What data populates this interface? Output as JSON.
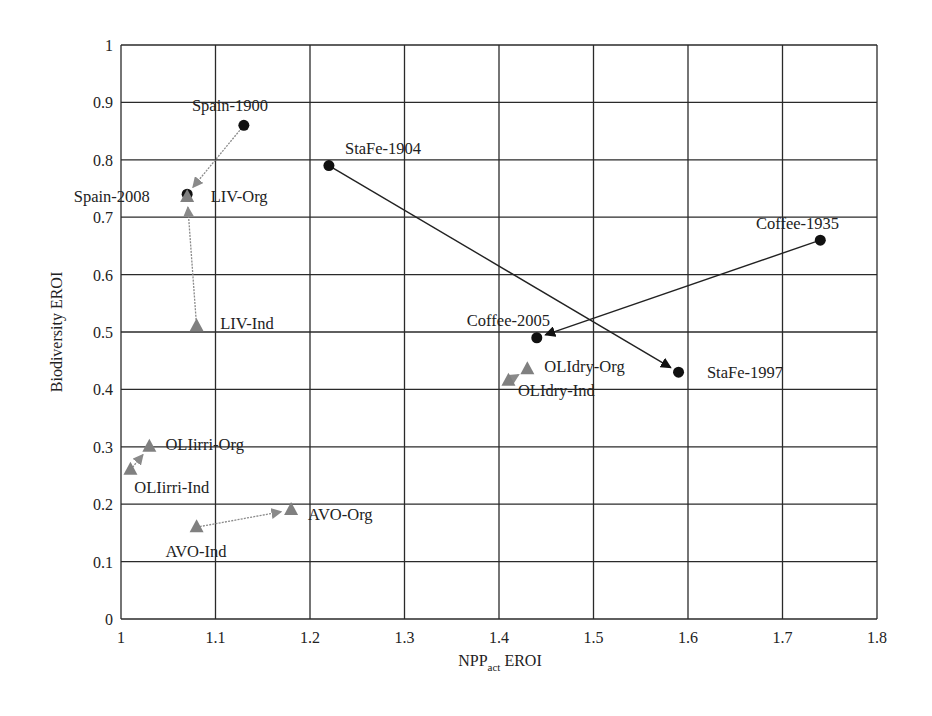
{
  "chart_data": {
    "type": "scatter",
    "title": "",
    "xlabel": "NPP_act EROI",
    "xlabel_main": "NPP",
    "xlabel_sub": "act",
    "xlabel_suffix": " EROI",
    "ylabel": "Biodiversity EROI",
    "xlim": [
      1,
      1.8
    ],
    "ylim": [
      0,
      1
    ],
    "x_ticks": [
      "1",
      "1.1",
      "1.2",
      "1.3",
      "1.4",
      "1.5",
      "1.6",
      "1.7",
      "1.8"
    ],
    "y_ticks": [
      "0",
      "0.1",
      "0.2",
      "0.3",
      "0.4",
      "0.5",
      "0.6",
      "0.7",
      "0.8",
      "0.9",
      "1"
    ],
    "grid": true,
    "legend": "none",
    "series": [
      {
        "name": "Spain",
        "marker": "circle",
        "color": "#111111",
        "arrow_color": "#8a8a8a",
        "arrow_style": "dotted",
        "points": [
          {
            "label": "Spain-1900",
            "x": 1.13,
            "y": 0.86
          },
          {
            "label": "Spain-2008",
            "x": 1.07,
            "y": 0.74
          }
        ]
      },
      {
        "name": "LIV",
        "marker": "triangle",
        "color": "#808080",
        "arrow_color": "#8a8a8a",
        "arrow_style": "dotted",
        "points": [
          {
            "label": "LIV-Ind",
            "x": 1.08,
            "y": 0.51
          },
          {
            "label": "LIV-Org",
            "x": 1.07,
            "y": 0.735
          }
        ]
      },
      {
        "name": "StaFe",
        "marker": "circle",
        "color": "#111111",
        "arrow_color": "#222222",
        "arrow_style": "solid",
        "points": [
          {
            "label": "StaFe-1904",
            "x": 1.22,
            "y": 0.79
          },
          {
            "label": "StaFe-1997",
            "x": 1.59,
            "y": 0.43
          }
        ]
      },
      {
        "name": "Coffee",
        "marker": "circle",
        "color": "#111111",
        "arrow_color": "#222222",
        "arrow_style": "solid",
        "points": [
          {
            "label": "Coffee-1935",
            "x": 1.74,
            "y": 0.66
          },
          {
            "label": "Coffee-2005",
            "x": 1.44,
            "y": 0.49
          }
        ]
      },
      {
        "name": "OLIdry",
        "marker": "triangle",
        "color": "#808080",
        "arrow_color": "#8a8a8a",
        "arrow_style": "dotted",
        "points": [
          {
            "label": "OLIdry-Ind",
            "x": 1.41,
            "y": 0.415
          },
          {
            "label": "OLIdry-Org",
            "x": 1.43,
            "y": 0.435
          }
        ]
      },
      {
        "name": "OLIirri",
        "marker": "triangle",
        "color": "#808080",
        "arrow_color": "#8a8a8a",
        "arrow_style": "dotted",
        "points": [
          {
            "label": "OLIirri-Ind",
            "x": 1.01,
            "y": 0.26
          },
          {
            "label": "OLIirri-Org",
            "x": 1.03,
            "y": 0.3
          }
        ]
      },
      {
        "name": "AVO",
        "marker": "triangle",
        "color": "#808080",
        "arrow_color": "#8a8a8a",
        "arrow_style": "dotted",
        "points": [
          {
            "label": "AVO-Ind",
            "x": 1.08,
            "y": 0.16
          },
          {
            "label": "AVO-Org",
            "x": 1.18,
            "y": 0.19
          }
        ]
      }
    ],
    "annotations": [
      {
        "text": "Spain-1900",
        "x": 1.075,
        "y": 0.885
      },
      {
        "text": "Spain-2008",
        "x": 0.95,
        "y": 0.727
      },
      {
        "text": "LIV-Org",
        "x": 1.095,
        "y": 0.727
      },
      {
        "text": "LIV-Ind",
        "x": 1.105,
        "y": 0.505
      },
      {
        "text": "StaFe-1904",
        "x": 1.237,
        "y": 0.81
      },
      {
        "text": "StaFe-1997",
        "x": 1.62,
        "y": 0.42
      },
      {
        "text": "Coffee-1935",
        "x": 1.672,
        "y": 0.68
      },
      {
        "text": "Coffee-2005",
        "x": 1.366,
        "y": 0.51
      },
      {
        "text": "OLIdry-Org",
        "x": 1.448,
        "y": 0.43
      },
      {
        "text": "OLIdry-Ind",
        "x": 1.42,
        "y": 0.388
      },
      {
        "text": "OLIirri-Org",
        "x": 1.047,
        "y": 0.295
      },
      {
        "text": "OLIirri-Ind",
        "x": 1.014,
        "y": 0.22
      },
      {
        "text": "AVO-Org",
        "x": 1.198,
        "y": 0.173
      },
      {
        "text": "AVO-Ind",
        "x": 1.047,
        "y": 0.108
      }
    ]
  }
}
